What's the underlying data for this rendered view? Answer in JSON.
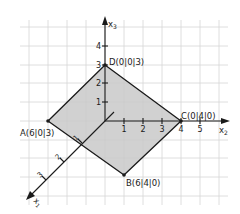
{
  "diagram": {
    "type": "3d-coordinate-system",
    "axes": {
      "x1": {
        "label": "x",
        "sub": "1",
        "ticks": [
          "1",
          "2",
          "3"
        ]
      },
      "x2": {
        "label": "x",
        "sub": "2",
        "ticks": [
          "1",
          "2",
          "3",
          "4",
          "5"
        ]
      },
      "x3": {
        "label": "x",
        "sub": "3",
        "ticks": [
          "1",
          "2",
          "3",
          "4"
        ]
      }
    },
    "points": [
      {
        "name": "A",
        "label": "A(6|0|3)",
        "coords": [
          6,
          0,
          3
        ]
      },
      {
        "name": "B",
        "label": "B(6|4|0)",
        "coords": [
          6,
          4,
          0
        ]
      },
      {
        "name": "C",
        "label": "C(0|4|0)",
        "coords": [
          0,
          4,
          0
        ]
      },
      {
        "name": "D",
        "label": "D(0|0|3)",
        "coords": [
          0,
          0,
          3
        ]
      }
    ],
    "polygon": [
      "A",
      "B",
      "C",
      "D"
    ],
    "colors": {
      "fill": "#c8c8c8",
      "edge": "#1a1a1a",
      "grid": "#d4d4d4",
      "axis": "#1a1a1a"
    }
  }
}
